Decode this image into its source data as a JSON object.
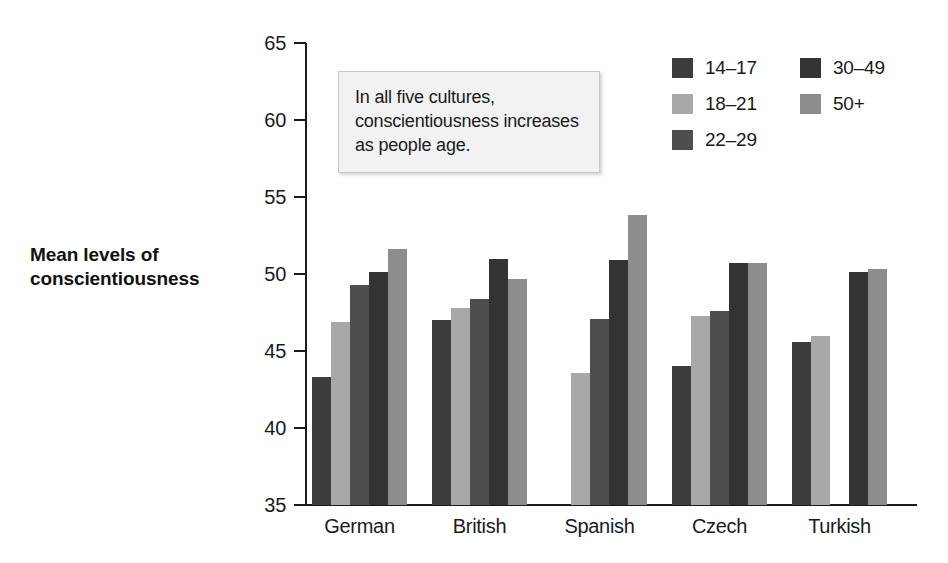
{
  "y_axis_title": "Mean levels of conscientiousness",
  "annotation": "In all five cultures, conscientiousness increases as people age.",
  "legend": {
    "left_column": [
      {
        "label": "14–17",
        "color": "#3d3d3d"
      },
      {
        "label": "18–21",
        "color": "#a8a8a8"
      },
      {
        "label": "22–29",
        "color": "#4e4e4e"
      }
    ],
    "right_column": [
      {
        "label": "30–49",
        "color": "#333333"
      },
      {
        "label": "50+",
        "color": "#8d8d8d"
      }
    ]
  },
  "chart_data": {
    "type": "bar",
    "title": "",
    "xlabel": "",
    "ylabel": "Mean levels of conscientiousness",
    "ylim": [
      35,
      65
    ],
    "yticks": [
      35,
      40,
      45,
      50,
      55,
      60,
      65
    ],
    "ytick_labels": [
      "35",
      "40",
      "45",
      "50",
      "55",
      "60",
      "65"
    ],
    "grid": false,
    "legend_position": "top-right",
    "categories": [
      "German",
      "British",
      "Spanish",
      "Czech",
      "Turkish"
    ],
    "series": [
      {
        "name": "14–17",
        "color": "#3d3d3d",
        "values": [
          43.3,
          47.0,
          null,
          44.0,
          45.6
        ]
      },
      {
        "name": "18–21",
        "color": "#a8a8a8",
        "values": [
          46.9,
          47.8,
          43.6,
          47.3,
          46.0
        ]
      },
      {
        "name": "22–29",
        "color": "#4e4e4e",
        "values": [
          49.3,
          48.4,
          47.1,
          47.6,
          null
        ]
      },
      {
        "name": "30–49",
        "color": "#333333",
        "values": [
          50.1,
          51.0,
          50.9,
          50.7,
          50.1
        ]
      },
      {
        "name": "50+",
        "color": "#8d8d8d",
        "values": [
          51.6,
          49.7,
          53.8,
          50.7,
          50.3
        ]
      }
    ],
    "annotations": [
      {
        "text": "In all five cultures, conscientiousness increases as people age."
      }
    ]
  }
}
